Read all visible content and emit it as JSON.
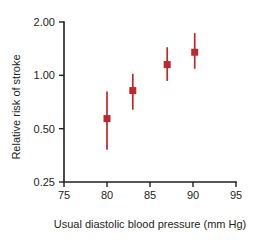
{
  "chart_data": {
    "type": "scatter",
    "title": "",
    "xlabel": "Usual diastolic blood pressure (mm Hg)",
    "ylabel": "Relative risk of stroke",
    "xlim": [
      75,
      95
    ],
    "ylim": [
      0.25,
      2.0
    ],
    "yscale": "log",
    "grid": false,
    "legend": "none",
    "marker_color": "#c0272d",
    "errorbar_color": "#c0272d",
    "axis_color": "#231f20",
    "xticks": [
      "75",
      "80",
      "85",
      "90",
      "95"
    ],
    "xtick_values": [
      75,
      80,
      85,
      90,
      95
    ],
    "yticks": [
      "0.25",
      "0.50",
      "1.00",
      "2.00"
    ],
    "ytick_values": [
      0.25,
      0.5,
      1.0,
      2.0
    ],
    "x": [
      80.0,
      83.0,
      87.0,
      90.2
    ],
    "values": [
      0.57,
      0.82,
      1.15,
      1.35
    ],
    "error_low": [
      0.38,
      0.64,
      0.93,
      1.09
    ],
    "error_high": [
      0.81,
      1.02,
      1.44,
      1.73
    ],
    "points": [
      {
        "x": 80.0,
        "y": 0.57,
        "low": 0.38,
        "high": 0.81
      },
      {
        "x": 83.0,
        "y": 0.82,
        "low": 0.64,
        "high": 1.02
      },
      {
        "x": 87.0,
        "y": 1.15,
        "low": 0.93,
        "high": 1.44
      },
      {
        "x": 90.2,
        "y": 1.35,
        "low": 1.09,
        "high": 1.73
      }
    ]
  }
}
